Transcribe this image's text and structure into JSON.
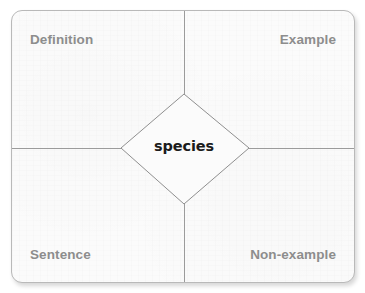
{
  "diagram": {
    "type": "frayer-model",
    "center_term": "species",
    "quadrants": [
      {
        "position": "top-left",
        "label": "Definition"
      },
      {
        "position": "top-right",
        "label": "Example"
      },
      {
        "position": "bottom-left",
        "label": "Sentence"
      },
      {
        "position": "bottom-right",
        "label": "Non-example"
      }
    ],
    "colors": {
      "card_background": "#fbfbfb",
      "card_border": "#b9b9b9",
      "divider_line": "#9b9b9b",
      "diamond_stroke": "#8f8f8f",
      "quadrant_label_text": "#8d8d8d",
      "center_term_text": "#1c1c1c",
      "page_background": "#ffffff"
    }
  }
}
